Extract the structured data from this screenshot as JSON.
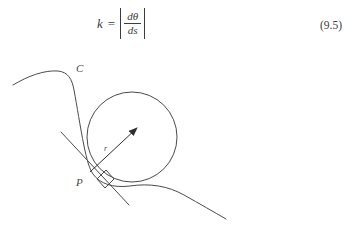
{
  "page": {
    "background_color": "#ffffff",
    "ink_color": "#4a4a4a"
  },
  "equation": {
    "lhs": "k",
    "relation": "=",
    "abs_open": "|",
    "abs_close": "|",
    "numerator": "dθ",
    "denominator": "ds",
    "plain_text": "k = |dθ/ds|",
    "number": "(9.5)"
  },
  "figure": {
    "type": "geometry-diagram",
    "labels": {
      "curve": "C",
      "point": "P",
      "radius": "r"
    },
    "elements": {
      "curve_label_position": [
        78,
        17
      ],
      "point_label_position": [
        80,
        125
      ],
      "radius_label_position": [
        106,
        90
      ],
      "circle": {
        "cx": 132,
        "cy": 85,
        "r": 45
      },
      "tangent_line": {
        "x1": 62,
        "y1": 81,
        "x2": 129,
        "y2": 153
      },
      "radius_arrow": {
        "x1": 90,
        "y1": 120,
        "x2": 138,
        "y2": 75
      },
      "right_angle_marker": true
    },
    "stroke_width": 1
  }
}
